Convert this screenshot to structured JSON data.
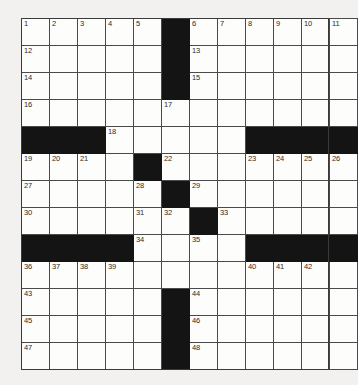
{
  "puzzle": {
    "title": "Crossword Grid",
    "rows": 13,
    "cols": 11,
    "cell_width_px": 28,
    "cell_height_px": 27,
    "colors": {
      "page_background": "#f2f1ef",
      "cell_fill": "#fdfdfb",
      "block_fill": "#141414",
      "grid_line": "#4a4a4a",
      "number_text": "#2b2b2b"
    },
    "max_clue_number": 48,
    "grid": [
      [
        {
          "block": false,
          "number": "1"
        },
        {
          "block": false,
          "number": "2"
        },
        {
          "block": false,
          "number": "3"
        },
        {
          "block": false,
          "number": "4"
        },
        {
          "block": false,
          "number": "5"
        },
        {
          "block": true,
          "number": ""
        },
        {
          "block": false,
          "number": "6"
        },
        {
          "block": false,
          "number": "7"
        },
        {
          "block": false,
          "number": "8"
        },
        {
          "block": false,
          "number": "9"
        },
        {
          "block": false,
          "number": "10"
        },
        {
          "block": false,
          "number": "11"
        }
      ],
      [
        {
          "block": false,
          "number": "12"
        },
        {
          "block": false,
          "number": ""
        },
        {
          "block": false,
          "number": ""
        },
        {
          "block": false,
          "number": ""
        },
        {
          "block": false,
          "number": ""
        },
        {
          "block": true,
          "number": ""
        },
        {
          "block": false,
          "number": "13"
        },
        {
          "block": false,
          "number": ""
        },
        {
          "block": false,
          "number": ""
        },
        {
          "block": false,
          "number": ""
        },
        {
          "block": false,
          "number": ""
        },
        {
          "block": false,
          "number": ""
        }
      ],
      [
        {
          "block": false,
          "number": "14"
        },
        {
          "block": false,
          "number": ""
        },
        {
          "block": false,
          "number": ""
        },
        {
          "block": false,
          "number": ""
        },
        {
          "block": false,
          "number": ""
        },
        {
          "block": true,
          "number": ""
        },
        {
          "block": false,
          "number": "15"
        },
        {
          "block": false,
          "number": ""
        },
        {
          "block": false,
          "number": ""
        },
        {
          "block": false,
          "number": ""
        },
        {
          "block": false,
          "number": ""
        },
        {
          "block": false,
          "number": ""
        }
      ],
      [
        {
          "block": false,
          "number": "16"
        },
        {
          "block": false,
          "number": ""
        },
        {
          "block": false,
          "number": ""
        },
        {
          "block": false,
          "number": ""
        },
        {
          "block": false,
          "number": ""
        },
        {
          "block": false,
          "number": "17"
        },
        {
          "block": false,
          "number": ""
        },
        {
          "block": false,
          "number": ""
        },
        {
          "block": false,
          "number": ""
        },
        {
          "block": false,
          "number": ""
        },
        {
          "block": false,
          "number": ""
        },
        {
          "block": false,
          "number": ""
        }
      ],
      [
        {
          "block": true,
          "number": ""
        },
        {
          "block": true,
          "number": ""
        },
        {
          "block": true,
          "number": ""
        },
        {
          "block": false,
          "number": "18"
        },
        {
          "block": false,
          "number": ""
        },
        {
          "block": false,
          "number": ""
        },
        {
          "block": false,
          "number": ""
        },
        {
          "block": false,
          "number": ""
        },
        {
          "block": true,
          "number": ""
        },
        {
          "block": true,
          "number": ""
        },
        {
          "block": true,
          "number": ""
        },
        {
          "block": true,
          "number": ""
        }
      ],
      [
        {
          "block": false,
          "number": "19"
        },
        {
          "block": false,
          "number": "20"
        },
        {
          "block": false,
          "number": "21"
        },
        {
          "block": false,
          "number": ""
        },
        {
          "block": true,
          "number": ""
        },
        {
          "block": false,
          "number": "22"
        },
        {
          "block": false,
          "number": ""
        },
        {
          "block": false,
          "number": ""
        },
        {
          "block": false,
          "number": "23"
        },
        {
          "block": false,
          "number": "24"
        },
        {
          "block": false,
          "number": "25"
        },
        {
          "block": false,
          "number": "26"
        }
      ],
      [
        {
          "block": false,
          "number": "27"
        },
        {
          "block": false,
          "number": ""
        },
        {
          "block": false,
          "number": ""
        },
        {
          "block": false,
          "number": ""
        },
        {
          "block": false,
          "number": "28"
        },
        {
          "block": true,
          "number": ""
        },
        {
          "block": false,
          "number": "29"
        },
        {
          "block": false,
          "number": ""
        },
        {
          "block": false,
          "number": ""
        },
        {
          "block": false,
          "number": ""
        },
        {
          "block": false,
          "number": ""
        },
        {
          "block": false,
          "number": ""
        }
      ],
      [
        {
          "block": false,
          "number": "30"
        },
        {
          "block": false,
          "number": ""
        },
        {
          "block": false,
          "number": ""
        },
        {
          "block": false,
          "number": ""
        },
        {
          "block": false,
          "number": "31"
        },
        {
          "block": false,
          "number": "32"
        },
        {
          "block": true,
          "number": ""
        },
        {
          "block": false,
          "number": "33"
        },
        {
          "block": false,
          "number": ""
        },
        {
          "block": false,
          "number": ""
        },
        {
          "block": false,
          "number": ""
        },
        {
          "block": false,
          "number": ""
        }
      ],
      [
        {
          "block": true,
          "number": ""
        },
        {
          "block": true,
          "number": ""
        },
        {
          "block": true,
          "number": ""
        },
        {
          "block": true,
          "number": ""
        },
        {
          "block": false,
          "number": "34"
        },
        {
          "block": false,
          "number": ""
        },
        {
          "block": false,
          "number": "35"
        },
        {
          "block": false,
          "number": ""
        },
        {
          "block": true,
          "number": ""
        },
        {
          "block": true,
          "number": ""
        },
        {
          "block": true,
          "number": ""
        },
        {
          "block": true,
          "number": ""
        }
      ],
      [
        {
          "block": false,
          "number": "36"
        },
        {
          "block": false,
          "number": "37"
        },
        {
          "block": false,
          "number": "38"
        },
        {
          "block": false,
          "number": "39"
        },
        {
          "block": false,
          "number": ""
        },
        {
          "block": false,
          "number": ""
        },
        {
          "block": false,
          "number": ""
        },
        {
          "block": false,
          "number": ""
        },
        {
          "block": false,
          "number": "40"
        },
        {
          "block": false,
          "number": "41"
        },
        {
          "block": false,
          "number": "42"
        },
        {
          "block": false,
          "number": ""
        }
      ],
      [
        {
          "block": false,
          "number": "43"
        },
        {
          "block": false,
          "number": ""
        },
        {
          "block": false,
          "number": ""
        },
        {
          "block": false,
          "number": ""
        },
        {
          "block": false,
          "number": ""
        },
        {
          "block": true,
          "number": ""
        },
        {
          "block": false,
          "number": "44"
        },
        {
          "block": false,
          "number": ""
        },
        {
          "block": false,
          "number": ""
        },
        {
          "block": false,
          "number": ""
        },
        {
          "block": false,
          "number": ""
        },
        {
          "block": false,
          "number": ""
        }
      ],
      [
        {
          "block": false,
          "number": "45"
        },
        {
          "block": false,
          "number": ""
        },
        {
          "block": false,
          "number": ""
        },
        {
          "block": false,
          "number": ""
        },
        {
          "block": false,
          "number": ""
        },
        {
          "block": true,
          "number": ""
        },
        {
          "block": false,
          "number": "46"
        },
        {
          "block": false,
          "number": ""
        },
        {
          "block": false,
          "number": ""
        },
        {
          "block": false,
          "number": ""
        },
        {
          "block": false,
          "number": ""
        },
        {
          "block": false,
          "number": ""
        }
      ],
      [
        {
          "block": false,
          "number": "47"
        },
        {
          "block": false,
          "number": ""
        },
        {
          "block": false,
          "number": ""
        },
        {
          "block": false,
          "number": ""
        },
        {
          "block": false,
          "number": ""
        },
        {
          "block": true,
          "number": ""
        },
        {
          "block": false,
          "number": "48"
        },
        {
          "block": false,
          "number": ""
        },
        {
          "block": false,
          "number": ""
        },
        {
          "block": false,
          "number": ""
        },
        {
          "block": false,
          "number": ""
        },
        {
          "block": false,
          "number": ""
        }
      ]
    ]
  }
}
